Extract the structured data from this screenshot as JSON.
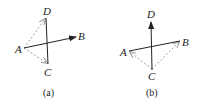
{
  "panels": [
    {
      "id": "a",
      "caption": "(a)",
      "labels": {
        "A": "A",
        "B": "B",
        "C": "C",
        "D": "D"
      },
      "solid_segments": [
        "D-C",
        "A→B"
      ],
      "dashed_vectors": [
        "A→D",
        "A→C"
      ]
    },
    {
      "id": "b",
      "caption": "(b)",
      "labels": {
        "A": "A",
        "B": "B",
        "C": "C",
        "D": "D"
      },
      "solid_segments": [
        "A-B",
        "C→D"
      ],
      "dashed_vectors": [
        "C→A",
        "C→B"
      ]
    }
  ],
  "colors": {
    "solid": "#222222",
    "dashed": "#a0a0a0"
  }
}
